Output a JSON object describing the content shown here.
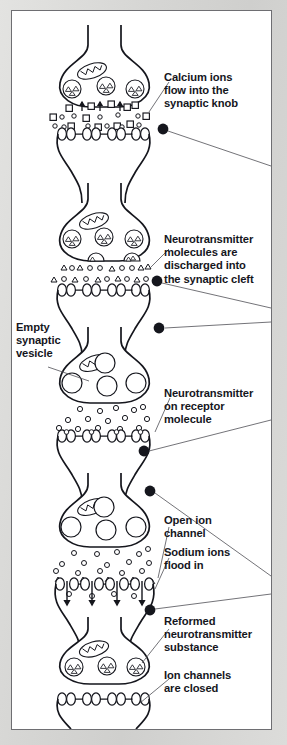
{
  "figure": {
    "type": "biological-diagram",
    "panel_count": 6,
    "frame_color": "#6e6e72",
    "page_background": "#d9d9d9",
    "panel_background": "#ffffff",
    "ink_color": "#15161d",
    "text_color": "#15161d"
  },
  "labels": {
    "calcium": "Calcium ions\nflow into the\nsynaptic knob",
    "neurotransmitter_discharged": "Neurotransmitter\nmolecules are\ndischarged into\nthe synaptic cleft",
    "empty_vesicle": "Empty\nsynaptic\nvesicle",
    "neurotransmitter_receptor": "Neurotransmitter\non receptor\nmolecule",
    "open_ion_channel": "Open ion\nchannel",
    "sodium_ions": "Sodium ions\nflood in",
    "reformed_neurotransmitter": "Reformed\nneurotransmitter\nsubstance",
    "ion_channels_closed": "Ion channels\nare closed"
  },
  "panels": [
    {
      "index": 1,
      "name": "calcium-influx",
      "particles": "squares and small circles",
      "vesicles_filled": 3,
      "mitochondria": 1,
      "channels": "closed",
      "label_keys": [
        "calcium"
      ]
    },
    {
      "index": 2,
      "name": "neurotransmitter-release",
      "particles": "triangles and small circles",
      "vesicles_filled": 3,
      "mitochondria": 1,
      "channels": "closed",
      "label_keys": [
        "neurotransmitter_discharged"
      ]
    },
    {
      "index": 3,
      "name": "empty-vesicles-binding",
      "particles": "small circles",
      "vesicles_empty": 4,
      "mitochondria": 1,
      "channels": "closed",
      "label_keys": [
        "empty_vesicle",
        "neurotransmitter_receptor"
      ]
    },
    {
      "index": 4,
      "name": "ion-channels-open",
      "particles": "small circles and triangles",
      "vesicles_empty": 4,
      "mitochondria": 1,
      "channels": "open",
      "arrows": 4,
      "label_keys": [
        "open_ion_channel",
        "sodium_ions"
      ]
    },
    {
      "index": 5,
      "name": "neurotransmitter-reformed",
      "vesicles_filled": 3,
      "mitochondria": 1,
      "channels": "closed",
      "label_keys": [
        "reformed_neurotransmitter"
      ]
    },
    {
      "index": 6,
      "name": "channels-closed",
      "channels": "closed",
      "label_keys": [
        "ion_channels_closed"
      ]
    }
  ],
  "markers": {
    "bullet_count": 4,
    "description": "filled black dots with leader lines running to the right frame edge"
  }
}
